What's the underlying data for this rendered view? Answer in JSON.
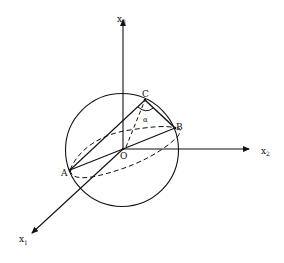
{
  "diagram": {
    "type": "sphere-with-coordinate-axes",
    "colors": {
      "stroke": "#111111",
      "background": "#ffffff"
    },
    "axes": [
      {
        "name": "x3",
        "base": "x",
        "subscript": "3",
        "direction": "up"
      },
      {
        "name": "x2",
        "base": "x",
        "subscript": "2",
        "direction": "right"
      },
      {
        "name": "x1",
        "base": "x",
        "subscript": "1",
        "direction": "down-left"
      }
    ],
    "points": [
      {
        "label": "O",
        "role": "origin / sphere center"
      },
      {
        "label": "A",
        "role": "point on sphere"
      },
      {
        "label": "B",
        "role": "point on sphere"
      },
      {
        "label": "C",
        "role": "point on sphere"
      }
    ],
    "angle": {
      "label": "α",
      "vertex": "C",
      "between": [
        "CA",
        "CB"
      ]
    },
    "segments": [
      {
        "from": "O",
        "to": "A",
        "style": "solid"
      },
      {
        "from": "O",
        "to": "B",
        "style": "solid"
      },
      {
        "from": "A",
        "to": "C",
        "style": "solid"
      },
      {
        "from": "C",
        "to": "B",
        "style": "solid"
      },
      {
        "from": "O",
        "to": "C",
        "style": "dashed"
      },
      {
        "from": "C",
        "to": "A-side",
        "style": "dashed"
      }
    ],
    "curves": [
      {
        "name": "equator-ellipse",
        "style": "dashed"
      },
      {
        "name": "great-circle-AB",
        "style": "dashed"
      }
    ]
  },
  "labels": {
    "x3_base": "x",
    "x3_sub": "3",
    "x2_base": "x",
    "x2_sub": "2",
    "x1_base": "x",
    "x1_sub": "1",
    "O": "O",
    "A": "A",
    "B": "B",
    "C": "C",
    "alpha": "α"
  }
}
